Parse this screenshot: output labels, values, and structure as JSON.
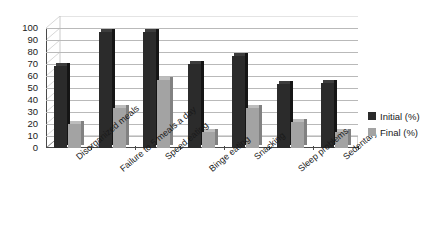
{
  "chart_data": {
    "type": "bar",
    "title": "",
    "subtitle": "",
    "xlabel": "",
    "ylabel": "",
    "ylim": [
      0,
      100
    ],
    "ytick_step": 10,
    "yticks": [
      "100",
      "90",
      "80",
      "70",
      "60",
      "50",
      "40",
      "30",
      "20",
      "10",
      "0"
    ],
    "grid": true,
    "legend_position": "right",
    "categories": [
      "Disorganized meals",
      "Failure to 5 meals a day",
      "Speed eating",
      "Binge eating",
      "Snacking",
      "Sleep problems",
      "Sedentary"
    ],
    "series": [
      {
        "name": "Initial (%)",
        "color": "#2b2b2b",
        "values": [
          68,
          97,
          97,
          70,
          77,
          53,
          54
        ]
      },
      {
        "name": "Final (%)",
        "color": "#a3a3a3",
        "values": [
          20,
          33,
          57,
          13,
          33,
          22,
          13
        ]
      }
    ]
  },
  "legend": {
    "items": [
      {
        "label": "Initial (%)"
      },
      {
        "label": "Final (%)"
      }
    ]
  }
}
